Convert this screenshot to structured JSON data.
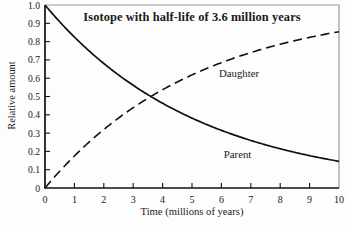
{
  "chart_data": {
    "type": "line",
    "title": "Isotope with half-life of 3.6 million years",
    "xlabel": "Time (millions of years)",
    "ylabel": "Relative amount",
    "xlim": [
      0,
      10
    ],
    "ylim": [
      0,
      1.0
    ],
    "x_tick_labels": [
      "0",
      "1",
      "2",
      "3",
      "4",
      "5",
      "6",
      "7",
      "8",
      "9",
      "10"
    ],
    "x_tick_values": [
      0,
      1,
      2,
      3,
      4,
      5,
      6,
      7,
      8,
      9,
      10
    ],
    "y_tick_labels": [
      "1.0",
      "0.9",
      "0.8",
      "0.7",
      "0.6",
      "0.5",
      "0.4",
      "0.3",
      "0.2",
      "0.1",
      "0"
    ],
    "y_tick_values": [
      1.0,
      0.9,
      0.8,
      0.7,
      0.6,
      0.5,
      0.4,
      0.3,
      0.2,
      0.1,
      0
    ],
    "half_life_myr": 3.6,
    "x": [
      0,
      1,
      2,
      3,
      4,
      5,
      6,
      7,
      8,
      9,
      10
    ],
    "series": [
      {
        "name": "Parent",
        "style": "solid",
        "values": [
          1.0,
          0.825,
          0.681,
          0.561,
          0.463,
          0.382,
          0.315,
          0.26,
          0.215,
          0.177,
          0.146
        ],
        "label_pos": {
          "x": 6.55,
          "y": 0.185
        }
      },
      {
        "name": "Daughter",
        "style": "dashed",
        "values": [
          0,
          0.175,
          0.319,
          0.439,
          0.537,
          0.618,
          0.685,
          0.74,
          0.785,
          0.823,
          0.854
        ],
        "label_pos": {
          "x": 6.6,
          "y": 0.63
        }
      }
    ],
    "grid": false,
    "legend": "inline-labels",
    "colors": {
      "curve": "#111111",
      "axis": "#111111",
      "frame_gray": "#9a9a9a",
      "text": "#1a1a1a",
      "background": "#fdfdfd"
    }
  }
}
